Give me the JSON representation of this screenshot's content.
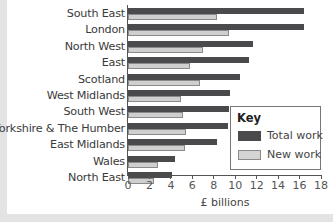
{
  "chart_data": {
    "type": "bar",
    "orientation": "horizontal",
    "title": "",
    "xlabel": "£ billions",
    "ylabel": "",
    "xlim": [
      0,
      18
    ],
    "xticks": [
      0,
      2,
      4,
      6,
      8,
      10,
      12,
      14,
      16,
      18
    ],
    "categories": [
      "South East",
      "London",
      "North West",
      "East",
      "Scotland",
      "West Midlands",
      "South West",
      "Yorkshire & The Humber",
      "East Midlands",
      "Wales",
      "North East"
    ],
    "series": [
      {
        "name": "Total work",
        "color": "#4a4a4c",
        "values": [
          16.4,
          16.4,
          11.7,
          11.3,
          10.4,
          9.5,
          9.4,
          9.3,
          8.3,
          4.4,
          4.1
        ]
      },
      {
        "name": "New work",
        "color": "#d4d4d4",
        "values": [
          8.3,
          9.4,
          7.0,
          5.8,
          6.7,
          4.9,
          5.1,
          5.4,
          5.3,
          2.8,
          2.4
        ]
      }
    ],
    "legend": {
      "title": "Key",
      "position": "lower-right",
      "entries": [
        "Total work",
        "New work"
      ]
    },
    "grid": false
  },
  "key": {
    "title": "Key",
    "total_label": "Total work",
    "new_label": "New work"
  },
  "axis": {
    "xlabel": "£ billions",
    "ticks": [
      "0",
      "2",
      "4",
      "6",
      "8",
      "10",
      "12",
      "14",
      "16",
      "18"
    ]
  }
}
